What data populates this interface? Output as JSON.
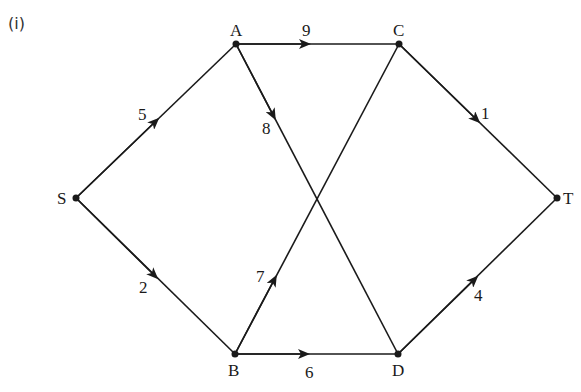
{
  "part_label": "(i)",
  "nodes": {
    "S": {
      "label": "S",
      "x": 76,
      "y": 198
    },
    "A": {
      "label": "A",
      "x": 236,
      "y": 44
    },
    "C": {
      "label": "C",
      "x": 399,
      "y": 44
    },
    "T": {
      "label": "T",
      "x": 557,
      "y": 198
    },
    "B": {
      "label": "B",
      "x": 235,
      "y": 354
    },
    "D": {
      "label": "D",
      "x": 398,
      "y": 354
    }
  },
  "edges": [
    {
      "from": "S",
      "to": "A",
      "weight": "5"
    },
    {
      "from": "S",
      "to": "B",
      "weight": "2"
    },
    {
      "from": "A",
      "to": "C",
      "weight": "9"
    },
    {
      "from": "A",
      "to": "D",
      "weight": "8"
    },
    {
      "from": "B",
      "to": "C",
      "weight": "7"
    },
    {
      "from": "B",
      "to": "D",
      "weight": "6"
    },
    {
      "from": "C",
      "to": "T",
      "weight": "1"
    },
    {
      "from": "D",
      "to": "T",
      "weight": "4"
    }
  ],
  "colors": {
    "line": "#1a1a1a",
    "background": "#ffffff"
  }
}
